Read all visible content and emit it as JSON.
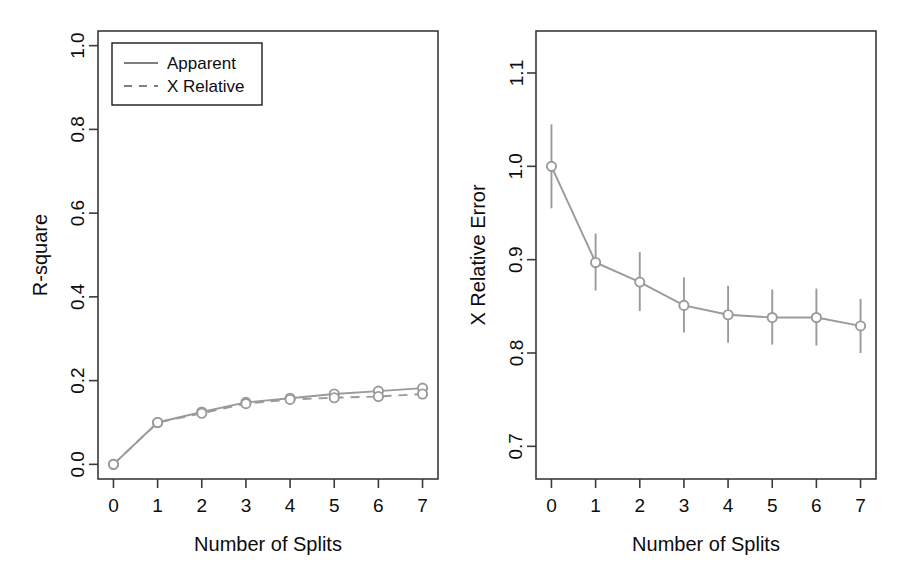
{
  "figure": {
    "background": "#ffffff",
    "series_color": "#9a9a9a",
    "frame_color": "#3a3a3a",
    "text_color": "#0d0d0d"
  },
  "chart_data": [
    {
      "type": "line",
      "panel": "left",
      "title": "",
      "xlabel": "Number of Splits",
      "ylabel": "R-square",
      "x": [
        0,
        1,
        2,
        3,
        4,
        5,
        6,
        7
      ],
      "xlim": [
        -0.35,
        7.35
      ],
      "ylim": [
        -0.035,
        1.035
      ],
      "xticks": [
        "0",
        "1",
        "2",
        "3",
        "4",
        "5",
        "6",
        "7"
      ],
      "yticks": [
        "0.0",
        "0.2",
        "0.4",
        "0.6",
        "0.8",
        "1.0"
      ],
      "ytick_values": [
        0.0,
        0.2,
        0.4,
        0.6,
        0.8,
        1.0
      ],
      "grid": false,
      "legend_position": "top-left",
      "marker": "open-circle",
      "series": [
        {
          "name": "Apparent",
          "linestyle": "solid",
          "values": [
            0.0,
            0.1,
            0.125,
            0.148,
            0.158,
            0.168,
            0.175,
            0.182
          ]
        },
        {
          "name": "X Relative",
          "linestyle": "dashed",
          "values": [
            0.0,
            0.1,
            0.122,
            0.145,
            0.155,
            0.159,
            0.162,
            0.168
          ]
        }
      ]
    },
    {
      "type": "line",
      "panel": "right",
      "title": "",
      "xlabel": "Number of Splits",
      "ylabel": "X Relative Error",
      "x": [
        0,
        1,
        2,
        3,
        4,
        5,
        6,
        7
      ],
      "xlim": [
        -0.35,
        7.35
      ],
      "ylim": [
        0.665,
        1.145
      ],
      "xticks": [
        "0",
        "1",
        "2",
        "3",
        "4",
        "5",
        "6",
        "7"
      ],
      "yticks": [
        "0.7",
        "0.8",
        "0.9",
        "1.0",
        "1.1"
      ],
      "ytick_values": [
        0.7,
        0.8,
        0.9,
        1.0,
        1.1
      ],
      "grid": false,
      "legend_position": "none",
      "marker": "open-circle",
      "errorbar_caps": false,
      "series": [
        {
          "name": "X Relative Error",
          "linestyle": "solid",
          "values": [
            1.0,
            0.897,
            0.876,
            0.851,
            0.841,
            0.838,
            0.838,
            0.829
          ],
          "err_low": [
            0.955,
            0.867,
            0.845,
            0.822,
            0.811,
            0.809,
            0.808,
            0.8
          ],
          "err_high": [
            1.045,
            0.928,
            0.908,
            0.881,
            0.872,
            0.868,
            0.869,
            0.858
          ]
        }
      ]
    }
  ]
}
